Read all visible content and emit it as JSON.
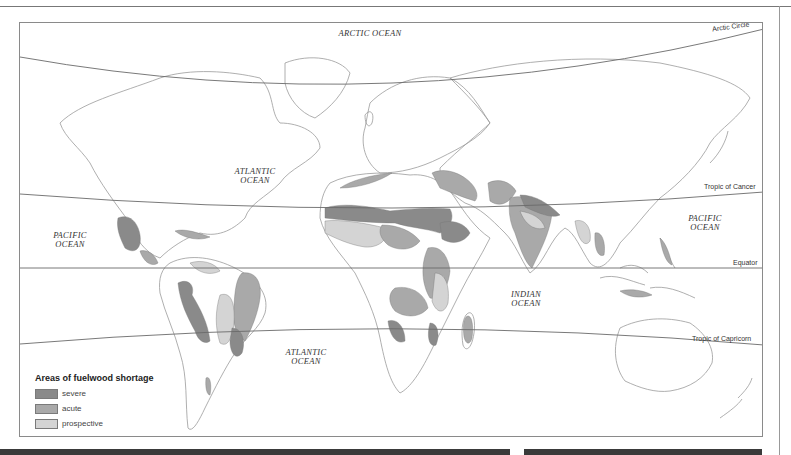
{
  "map": {
    "title": "Areas of fuelwood shortage",
    "oceans": [
      {
        "id": "arctic",
        "label": "ARCTIC OCEAN"
      },
      {
        "id": "atlantic-north",
        "label": "ATLANTIC\nOCEAN"
      },
      {
        "id": "pacific-east",
        "label": "PACIFIC\nOCEAN"
      },
      {
        "id": "pacific-west",
        "label": "PACIFIC\nOCEAN"
      },
      {
        "id": "indian",
        "label": "INDIAN\nOCEAN"
      },
      {
        "id": "atlantic-south",
        "label": "ATLANTIC\nOCEAN"
      }
    ],
    "reference_lines": [
      {
        "id": "arctic-circle",
        "label": "Arctic Circle"
      },
      {
        "id": "tropic-of-cancer",
        "label": "Tropic of Cancer"
      },
      {
        "id": "equator",
        "label": "Equator"
      },
      {
        "id": "tropic-of-capricorn",
        "label": "Tropic of Capricorn"
      }
    ]
  },
  "legend": {
    "title": "Areas of fuelwood shortage",
    "items": [
      {
        "label": "severe",
        "color": "#8a8a8a"
      },
      {
        "label": "acute",
        "color": "#a9a9a9"
      },
      {
        "label": "prospective",
        "color": "#d4d4d4"
      }
    ]
  },
  "colors": {
    "severe": "#8a8a8a",
    "acute": "#a9a9a9",
    "prospective": "#d4d4d4",
    "coastline": "#9a9a9a",
    "reference_line": "#6a6a6a"
  }
}
